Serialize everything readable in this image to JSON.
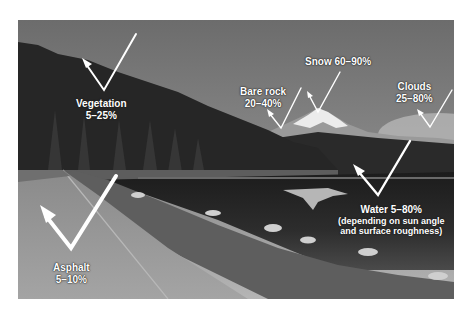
{
  "figure": {
    "annotations": [
      {
        "id": "vegetation",
        "lines": [
          "Vegetation",
          "5–25%"
        ],
        "surface": "Vegetation",
        "range": "5–25%"
      },
      {
        "id": "bare-rock",
        "lines": [
          "Bare rock",
          "20–40%"
        ],
        "surface": "Bare rock",
        "range": "20–40%"
      },
      {
        "id": "snow",
        "lines": [
          "Snow 60–90%"
        ],
        "surface": "Snow",
        "range": "60–90%"
      },
      {
        "id": "clouds",
        "lines": [
          "Clouds",
          "25–80%"
        ],
        "surface": "Clouds",
        "range": "25–80%"
      },
      {
        "id": "water",
        "lines": [
          "Water 5–80%",
          "(depending on sun angle",
          "and surface roughness)"
        ],
        "surface": "Water",
        "range": "5–80%",
        "note": "depending on sun angle and surface roughness"
      },
      {
        "id": "asphalt",
        "lines": [
          "Asphalt",
          "5–10%"
        ],
        "surface": "Asphalt",
        "range": "5–10%"
      }
    ],
    "colors": {
      "arrow": "#ffffff",
      "label_text": "#ffffff",
      "background": "#ffffff"
    }
  }
}
